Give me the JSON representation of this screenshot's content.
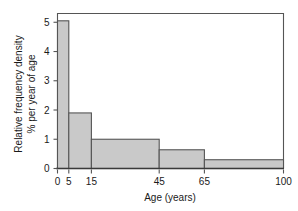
{
  "chart_data": {
    "type": "bar",
    "title": "",
    "subtitle": "",
    "xlabel": "Age (years)",
    "ylabel_line1": "Relative frequency density",
    "ylabel_line2": "% per year of age",
    "ylabel": "Relative frequency density % per year of age",
    "categories": [
      "0–5",
      "5–15",
      "15–45",
      "45–65",
      "65–100"
    ],
    "bin_edges": [
      0,
      5,
      15,
      45,
      65,
      100
    ],
    "values": [
      5.05,
      1.9,
      1.0,
      0.64,
      0.3
    ],
    "xlim": [
      0,
      100
    ],
    "ylim": [
      0,
      5.3
    ],
    "xticks": [
      0,
      5,
      15,
      45,
      65,
      100
    ],
    "xtick_labels": [
      "0",
      "5",
      "15",
      "45",
      "65",
      "100"
    ],
    "yticks": [
      0,
      1,
      2,
      3,
      4,
      5
    ],
    "ytick_labels": [
      "0",
      "1",
      "2",
      "3",
      "4",
      "5"
    ],
    "grid": false,
    "legend": false,
    "legend_position": "none",
    "bar_fill_color": "#c9c9c9",
    "bar_edge_color": "#555555",
    "axis_color": "#555555",
    "text_color": "#1a1a1a",
    "background_color": "#ffffff"
  }
}
